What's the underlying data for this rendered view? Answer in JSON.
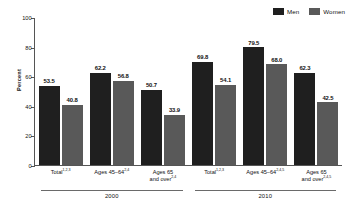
{
  "chart_data": {
    "type": "bar",
    "title": "",
    "xlabel": "",
    "ylabel": "Percent",
    "ylim": [
      0,
      100
    ],
    "yticks": [
      0,
      20,
      40,
      60,
      80,
      100
    ],
    "grid": false,
    "legend_position": "top-right",
    "categories": [
      "Total",
      "Ages 45–64",
      "Ages 65 and over",
      "Total",
      "Ages 45–64",
      "Ages 65 and over"
    ],
    "groups": [
      "2000",
      "2010"
    ],
    "series": [
      {
        "name": "Men",
        "values": [
          53.5,
          62.2,
          50.7,
          69.8,
          79.5,
          62.3
        ],
        "color": "#1f1f1f"
      },
      {
        "name": "Women",
        "values": [
          40.8,
          56.8,
          33.9,
          54.1,
          68.0,
          42.5
        ],
        "color": "#595959"
      }
    ]
  },
  "legend": {
    "entries": [
      {
        "label": "Men",
        "color": "#1f1f1f"
      },
      {
        "label": "Women",
        "color": "#595959"
      }
    ]
  },
  "axis": {
    "ylabel": "Percent",
    "ticks": [
      {
        "value": 100,
        "label": "100"
      },
      {
        "value": 80,
        "label": "80"
      },
      {
        "value": 60,
        "label": "60"
      },
      {
        "value": 40,
        "label": "40"
      },
      {
        "value": 20,
        "label": "20"
      },
      {
        "value": 0,
        "label": "0"
      }
    ]
  },
  "panels": [
    {
      "year": "2000",
      "pairs": [
        {
          "label": "Total",
          "label_line2": "",
          "footnote": "1,2,3",
          "men": {
            "value": 53.5,
            "label": "53.5"
          },
          "women": {
            "value": 40.8,
            "label": "40.8"
          }
        },
        {
          "label": "Ages 45–64",
          "label_line2": "",
          "footnote": "2,4",
          "men": {
            "value": 62.2,
            "label": "62.2"
          },
          "women": {
            "value": 56.8,
            "label": "56.8"
          }
        },
        {
          "label": "Ages 65",
          "label_line2": "and over",
          "footnote": "2,4",
          "men": {
            "value": 50.7,
            "label": "50.7"
          },
          "women": {
            "value": 33.9,
            "label": "33.9"
          }
        }
      ]
    },
    {
      "year": "2010",
      "pairs": [
        {
          "label": "Total",
          "label_line2": "",
          "footnote": "1,2,3",
          "men": {
            "value": 69.8,
            "label": "69.8"
          },
          "women": {
            "value": 54.1,
            "label": "54.1"
          }
        },
        {
          "label": "Ages 45–64",
          "label_line2": "",
          "footnote": "2,4,5",
          "men": {
            "value": 79.5,
            "label": "79.5"
          },
          "women": {
            "value": 68.0,
            "label": "68.0"
          }
        },
        {
          "label": "Ages 65",
          "label_line2": "and over",
          "footnote": "2,4,5",
          "men": {
            "value": 62.3,
            "label": "62.3"
          },
          "women": {
            "value": 42.5,
            "label": "42.5"
          }
        }
      ]
    }
  ]
}
